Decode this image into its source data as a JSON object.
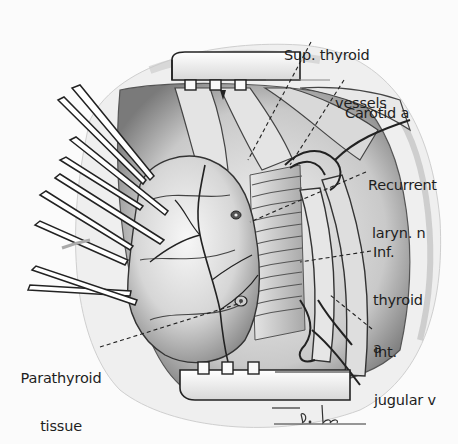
{
  "figure": {
    "type": "surgical-illustration",
    "signature": "D. Lee",
    "colors": {
      "ink": "#1e1e1e",
      "background": "#fbfbfb",
      "shade_dark": "#555555",
      "shade_mid": "#9a9a9a",
      "shade_light": "#dcdcdc"
    }
  },
  "labels": {
    "sup_thyroid": {
      "line1": "Sup. thyroid",
      "line2": "vessels"
    },
    "carotid": {
      "line1": "Carotid a"
    },
    "recurrent": {
      "line1": "Recurrent",
      "line2": "laryn. n"
    },
    "inf_thyroid": {
      "line1": "Inf.",
      "line2": "thyroid",
      "line3": "a"
    },
    "int_jugular": {
      "line1": "Int.",
      "line2": "jugular v"
    },
    "parathyroid": {
      "line1": "Parathyroid",
      "line2": "tissue"
    }
  }
}
